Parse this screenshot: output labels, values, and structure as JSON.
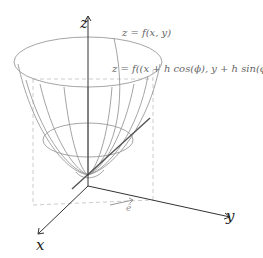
{
  "figure": {
    "axes": {
      "x_label": "x",
      "y_label": "y",
      "z_label": "z"
    },
    "labels": {
      "surface_eq": "z = f(x, y)",
      "slice_eq": "z = f((x + h cos(ϕ), y + h sin(ϕ))",
      "direction_vector": "ê"
    },
    "colors": {
      "axis": "#333333",
      "mesh": "#9a9a9a",
      "tangent": "#555555",
      "dashed": "#cccccc"
    }
  }
}
